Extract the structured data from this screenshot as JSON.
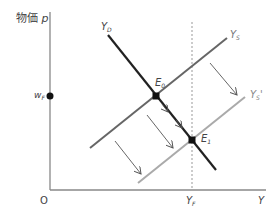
{
  "diagram": {
    "axes": {
      "y_label": "物価",
      "y_symbol": "p",
      "x_label": "Y",
      "origin": "O"
    },
    "curves": {
      "demand": {
        "base": "Y",
        "sub": "D"
      },
      "supply": {
        "base": "Y",
        "sub": "S"
      },
      "supply_shifted": {
        "base": "Y",
        "sub": "S",
        "prime": "'"
      }
    },
    "points": {
      "e0": {
        "base": "E",
        "sub": "0"
      },
      "e1": {
        "base": "E",
        "sub": "1"
      }
    },
    "axis_marks": {
      "price_level": {
        "base": "w",
        "sub": "F"
      },
      "full_employment_output": {
        "base": "Y",
        "sub": "F"
      }
    },
    "colors": {
      "axis": "#888888",
      "demand_line": "#222222",
      "supply_line": "#666666",
      "supply_shifted_line": "#aaaaaa",
      "dotted_line": "#999999",
      "arrow": "#555555",
      "point": "#111111"
    }
  }
}
